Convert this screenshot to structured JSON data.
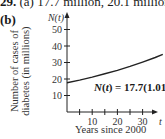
{
  "header": {
    "problem_number": "29.",
    "part_a_label": "(a)",
    "part_a_text": "17.7 million, 20.1 million",
    "part_b_label": "(b)"
  },
  "chart_data": {
    "type": "line",
    "title": "",
    "xlabel": "Years since 2000",
    "ylabel": "Number of cases of diabetes (in millions)",
    "x_axis_symbol": "t",
    "y_axis_symbol": "N(t)",
    "x_ticks": [
      5,
      10,
      15,
      20,
      25,
      30
    ],
    "x_tick_labels": [
      "10",
      "20",
      "30"
    ],
    "y_ticks": [
      10,
      20,
      30,
      40,
      50
    ],
    "y_tick_labels": [
      "10",
      "20",
      "30",
      "40",
      "50"
    ],
    "xlim": [
      0,
      38
    ],
    "ylim": [
      0,
      55
    ],
    "grid": false,
    "equation": "N(t) = 17.7(1.018)^t",
    "equation_base": "N(t) = 17.7(1.018)",
    "equation_exponent": "t",
    "series": [
      {
        "name": "N(t) = 17.7(1.018)^t",
        "x": [
          0,
          5,
          10,
          15,
          20,
          25,
          30,
          35,
          38
        ],
        "y": [
          17.7,
          19.35,
          21.16,
          23.13,
          25.29,
          27.65,
          30.23,
          33.05,
          34.88
        ]
      }
    ]
  }
}
